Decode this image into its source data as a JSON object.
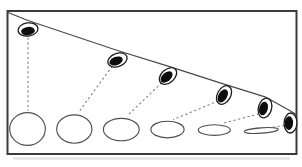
{
  "canvas": {
    "width": 302,
    "height": 167,
    "background": "#ffffff"
  },
  "colors": {
    "frame_stroke": "#3b3b3b",
    "shadow": "#c2c2c2",
    "slant_line": "#4a4a4a",
    "disk_outline": "#1d1d1d",
    "pupil_fill": "#0d0d0d",
    "disk_fill": "#ffffff",
    "sightline": "#7a7a7a",
    "projection_stroke": "#4f4f4f",
    "projection_fill": "#ffffff"
  },
  "frame": {
    "x": 7.5,
    "y": 11,
    "width": 289,
    "height": 143,
    "stroke_width": 2
  },
  "shadow_line": {
    "x1": 14,
    "y1": 158.5,
    "x2": 289,
    "y2": 158.5,
    "stroke_width": 2,
    "opacity": 0.55
  },
  "slant_line": {
    "points": "8,12.5 28,20.5 117.5,50.5 168,66.2 224,84.2 265,96.8 290.5,111 296.5,114.8",
    "stroke_width": 1.3
  },
  "tilted_disks": [
    {
      "cx": 28,
      "cy": 29.5,
      "rotation": -8,
      "outer_rx": 10,
      "outer_ry": 6.6,
      "pupil_rx": 6.9,
      "pupil_ry": 4.2,
      "pupil_dx": 0,
      "pupil_dy": 1.6
    },
    {
      "cx": 117.5,
      "cy": 60,
      "rotation": -20,
      "outer_rx": 10,
      "outer_ry": 6.6,
      "pupil_rx": 6.9,
      "pupil_ry": 4.2,
      "pupil_dx": -1.4,
      "pupil_dy": 1.0
    },
    {
      "cx": 168,
      "cy": 76,
      "rotation": -42,
      "outer_rx": 10,
      "outer_ry": 6.6,
      "pupil_rx": 7.0,
      "pupil_ry": 4.3,
      "pupil_dx": -1.4,
      "pupil_dy": 1.0
    },
    {
      "cx": 224,
      "cy": 95,
      "rotation": -60,
      "outer_rx": 10,
      "outer_ry": 6.6,
      "pupil_rx": 7.1,
      "pupil_ry": 4.4,
      "pupil_dx": -1.2,
      "pupil_dy": 0.9
    },
    {
      "cx": 265,
      "cy": 108,
      "rotation": -75,
      "outer_rx": 10,
      "outer_ry": 6.6,
      "pupil_rx": 7.0,
      "pupil_ry": 4.3,
      "pupil_dx": -1.5,
      "pupil_dy": 0.5
    },
    {
      "cx": 290.5,
      "cy": 123,
      "rotation": -88,
      "outer_rx": 10,
      "outer_ry": 6.4,
      "pupil_rx": 6.9,
      "pupil_ry": 4.2,
      "pupil_dx": -1.6,
      "pupil_dy": 0.1
    }
  ],
  "sightlines": [
    {
      "x1": 28,
      "y1": 38,
      "x2": 28,
      "y2": 110.5
    },
    {
      "x1": 112,
      "y1": 66.5,
      "x2": 78.5,
      "y2": 112.5
    },
    {
      "x1": 161.5,
      "y1": 83,
      "x2": 127.5,
      "y2": 115.5
    },
    {
      "x1": 218,
      "y1": 101,
      "x2": 173.5,
      "y2": 119.5
    },
    {
      "x1": 258.5,
      "y1": 114,
      "x2": 222,
      "y2": 123.5
    },
    {
      "x1": 284,
      "y1": 125.5,
      "x2": 264,
      "y2": 128.5
    }
  ],
  "projections": [
    {
      "cx": 27.5,
      "cy": 129,
      "rx": 17.8,
      "ry": 16.4,
      "rotation": 0
    },
    {
      "cx": 74.3,
      "cy": 129,
      "rx": 17.6,
      "ry": 14.2,
      "rotation": 0
    },
    {
      "cx": 121.3,
      "cy": 129.5,
      "rx": 17.9,
      "ry": 11.2,
      "rotation": 0
    },
    {
      "cx": 167.5,
      "cy": 129.5,
      "rx": 16.6,
      "ry": 8.3,
      "rotation": 0
    },
    {
      "cx": 214.3,
      "cy": 130,
      "rx": 16.0,
      "ry": 5.3,
      "rotation": 0
    },
    {
      "cx": 261.3,
      "cy": 130.5,
      "rx": 17.0,
      "ry": 2.7,
      "rotation": -4
    }
  ],
  "style": {
    "disk_stroke_width": 1.3,
    "projection_stroke_width": 1.15,
    "sightline_stroke_width": 1.05,
    "sightline_dash": "1.4 3.4"
  }
}
